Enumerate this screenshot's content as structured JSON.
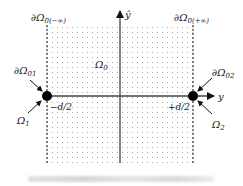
{
  "diagram": {
    "labels": {
      "boundary_left_top": "∂Ω",
      "boundary_left_top_sub": "0(−∞)",
      "boundary_right_top": "∂Ω",
      "boundary_right_top_sub": "0(+∞)",
      "region_center": "Ω",
      "region_center_sub": "0",
      "boundary_left_port": "∂Ω",
      "boundary_left_port_sub": "01",
      "boundary_right_port": "∂Ω",
      "boundary_right_port_sub": "02",
      "port_left": "Ω",
      "port_left_sub": "1",
      "port_right": "Ω",
      "port_right_sub": "2",
      "axis_horizontal": "y",
      "axis_vertical": "ŷ",
      "tick_left": "−d/2",
      "tick_right": "+d/2"
    },
    "colors": {
      "line": "#333333",
      "dots": "#9a9a9a",
      "marker": "#000000"
    }
  }
}
